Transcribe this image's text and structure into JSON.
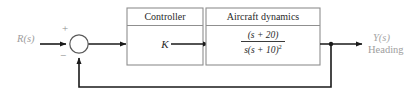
{
  "diagram": {
    "type": "control-system-block-diagram",
    "input": {
      "label": "R(s)"
    },
    "summing_junction": {
      "plus_sign": "+",
      "minus_sign": "−",
      "name": "summing-junction"
    },
    "blocks": [
      {
        "id": "controller",
        "title": "Controller",
        "body": "K"
      },
      {
        "id": "plant",
        "title": "Aircraft dynamics",
        "transfer_function": {
          "numerator": "(s + 20)",
          "denominator": "s(s + 10)",
          "denominator_exponent": "2"
        }
      }
    ],
    "output": {
      "label": "Y(s)",
      "sublabel": "Heading"
    },
    "colors": {
      "line": "#1a1a1a",
      "block_border": "#8f8f8f",
      "text": "#2a2a2a",
      "faded_text": "#9a9a9a",
      "background": "#ffffff"
    }
  }
}
